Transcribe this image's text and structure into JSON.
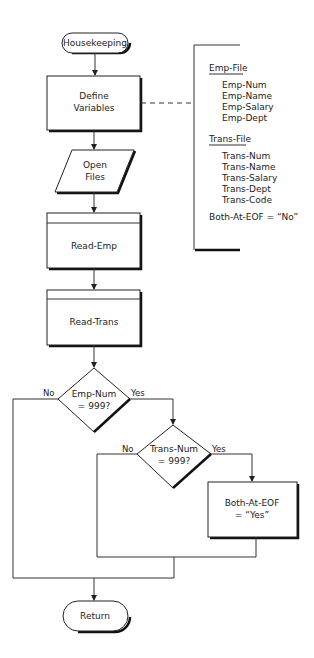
{
  "diagram": {
    "type": "flowchart",
    "nodes": {
      "start": {
        "kind": "terminal",
        "label": "Housekeeping"
      },
      "define": {
        "kind": "process",
        "lines": [
          "Define",
          "Variables"
        ]
      },
      "open": {
        "kind": "io",
        "lines": [
          "Open",
          "Files"
        ]
      },
      "read_emp": {
        "kind": "predefined-process",
        "label": "Read-Emp"
      },
      "read_trans": {
        "kind": "predefined-process",
        "label": "Read-Trans"
      },
      "decision1": {
        "kind": "decision",
        "lines": [
          "Emp-Num",
          "= 999?"
        ],
        "no": "No",
        "yes": "Yes"
      },
      "decision2": {
        "kind": "decision",
        "lines": [
          "Trans-Num",
          "= 999?"
        ],
        "no": "No",
        "yes": "Yes"
      },
      "set_eof": {
        "kind": "process",
        "lines": [
          "Both-At-EOF",
          "= “Yes”"
        ]
      },
      "end": {
        "kind": "terminal",
        "label": "Return"
      }
    },
    "annotation": {
      "emp_file": {
        "title": "Emp-File",
        "fields": [
          "Emp-Num",
          "Emp-Name",
          "Emp-Salary",
          "Emp-Dept"
        ]
      },
      "trans_file": {
        "title": "Trans-File",
        "fields": [
          "Trans-Num",
          "Trans-Name",
          "Trans-Salary",
          "Trans-Dept",
          "Trans-Code"
        ]
      },
      "flag": "Both-At-EOF = “No”"
    }
  }
}
